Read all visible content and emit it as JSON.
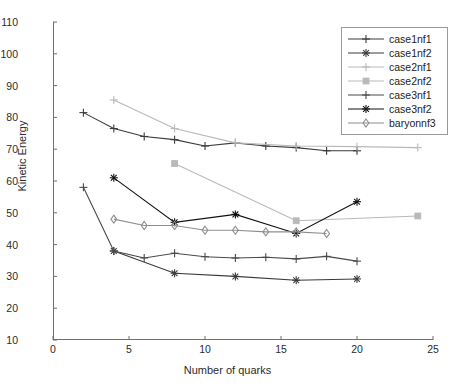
{
  "chart_data": {
    "type": "line",
    "title": "",
    "xlabel": "Number of quarks",
    "ylabel": "Kinetic Energy",
    "xlim": [
      0,
      25
    ],
    "ylim": [
      10,
      110
    ],
    "xticks": [
      0,
      5,
      10,
      15,
      20,
      25
    ],
    "yticks": [
      10,
      20,
      30,
      40,
      50,
      60,
      70,
      80,
      90,
      100,
      110
    ],
    "grid": false,
    "legend_position": "top-right",
    "series": [
      {
        "name": "case1nf1",
        "color": "#3a3a3a",
        "marker": "plus",
        "x": [
          2,
          4,
          6,
          8,
          10,
          12,
          14,
          16,
          18,
          20
        ],
        "y": [
          81.5,
          76.5,
          74.0,
          73.0,
          71.0,
          72.0,
          71.0,
          70.5,
          69.5,
          69.5
        ]
      },
      {
        "name": "case1nf2",
        "color": "#3a3a3a",
        "marker": "star",
        "x": [
          4,
          8,
          12,
          16,
          20
        ],
        "y": [
          38.0,
          31.0,
          30.0,
          28.8,
          29.2
        ]
      },
      {
        "name": "case2nf1",
        "color": "#b9b9b9",
        "marker": "plus",
        "x": [
          4,
          8,
          12,
          16,
          20,
          24
        ],
        "y": [
          85.5,
          76.5,
          72.0,
          71.0,
          70.8,
          70.5
        ]
      },
      {
        "name": "case2nf2",
        "color": "#b9b9b9",
        "marker": "square",
        "x": [
          8,
          16,
          24
        ],
        "y": [
          65.5,
          47.5,
          49.0
        ]
      },
      {
        "name": "case3nf1",
        "color": "#4a4a4a",
        "marker": "plus",
        "x": [
          2,
          4,
          6,
          8,
          10,
          12,
          14,
          16,
          18,
          20
        ],
        "y": [
          58.0,
          38.0,
          35.8,
          37.3,
          36.2,
          35.8,
          36.0,
          35.5,
          36.3,
          34.8
        ]
      },
      {
        "name": "case3nf2",
        "color": "#111111",
        "marker": "star",
        "x": [
          4,
          8,
          12,
          16,
          20
        ],
        "y": [
          61.0,
          47.0,
          49.5,
          43.5,
          53.5
        ]
      },
      {
        "name": "baryonnf3",
        "color": "#8e8e8e",
        "marker": "diamond",
        "x": [
          4,
          6,
          8,
          10,
          12,
          14,
          16,
          18
        ],
        "y": [
          48.0,
          46.0,
          46.0,
          44.5,
          44.5,
          44.0,
          44.0,
          43.5
        ]
      }
    ]
  },
  "axis": {
    "ylabel": "Kinetic Energy",
    "xlabel": "Number of quarks",
    "yticklabels": [
      "110",
      "100",
      "90",
      "80",
      "70",
      "60",
      "50",
      "40",
      "30",
      "20",
      "10"
    ],
    "xticklabels": [
      "0",
      "5",
      "10",
      "15",
      "20",
      "25"
    ]
  },
  "legend": {
    "items": [
      {
        "label": "case1nf1"
      },
      {
        "label": "case1nf2"
      },
      {
        "label": "case2nf1"
      },
      {
        "label": "case2nf2"
      },
      {
        "label": "case3nf1"
      },
      {
        "label": "case3nf2"
      },
      {
        "label": "baryonnf3"
      }
    ]
  }
}
